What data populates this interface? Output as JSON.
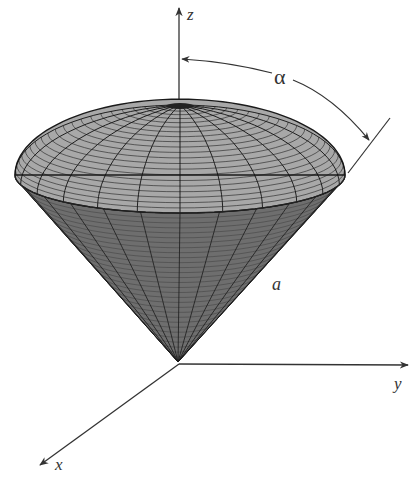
{
  "figure": {
    "labels": {
      "z_axis": "z",
      "y_axis": "y",
      "x_axis": "x",
      "angle": "α",
      "radius": "a"
    },
    "colors": {
      "background": "#ffffff",
      "cone_surface": "#6e6e6e",
      "cap_surface": "#a8a8a8",
      "mesh_lines": "#1a1a1a",
      "axes": "#333333"
    },
    "geometry": {
      "apex": [
        178,
        362
      ],
      "rim_center": [
        180,
        175
      ],
      "rim_rx": 165,
      "rim_ry": 38,
      "cap_top_y": 103,
      "meridians": 24,
      "cone_rings": 30,
      "cap_rings": 22
    }
  }
}
